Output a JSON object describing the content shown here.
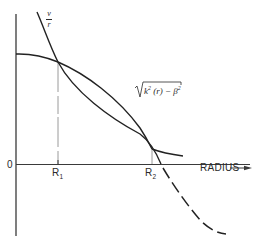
{
  "figure": {
    "axes": {
      "origin_label": "0",
      "x_axis_label": "RADIUS",
      "x_axis_arrow": "arrow-right"
    },
    "curves": {
      "v_over_r": {
        "numerator": "v",
        "denominator": "r",
        "style": "solid, continuing dashed below axis"
      },
      "sqrt_term": {
        "radical": "√",
        "k": "k",
        "k_exp": "2",
        "arg": "(r)",
        "minus": "−",
        "beta": "β",
        "beta_exp": "2",
        "style": "solid"
      }
    },
    "markers": {
      "r1": {
        "base": "R",
        "sub": "1"
      },
      "r2": {
        "base": "R",
        "sub": "2"
      }
    },
    "colors": {
      "line": "#2a2a2a",
      "guide": "#9a9a9a",
      "background": "#ffffff"
    }
  }
}
